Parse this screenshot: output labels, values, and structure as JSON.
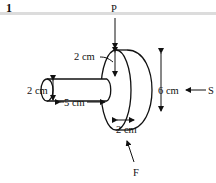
{
  "header": {
    "question_number": "1"
  },
  "diagram": {
    "forces": {
      "top": "P",
      "right": "S",
      "bottom": "F"
    },
    "dimensions": {
      "rod_diameter": "2 cm",
      "rod_length": "5 cm",
      "collar_step": "2 cm",
      "disc_diameter": "6 cm",
      "disc_thickness": "2 cm"
    }
  }
}
